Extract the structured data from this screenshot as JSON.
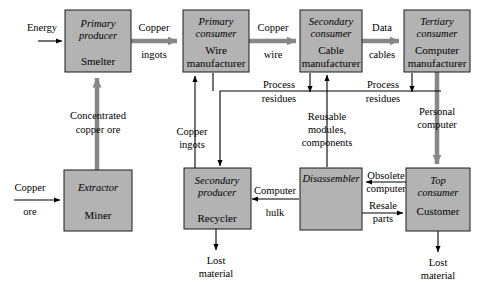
{
  "diagram": {
    "colors": {
      "node_fill": "#b3b3b3",
      "node_stroke": "#1a1a1a",
      "thin_arrow": "#000000",
      "thick_arrow": "#878787",
      "background": "#ffffff"
    },
    "nodes": [
      {
        "id": "primary_producer",
        "role": "Primary",
        "role2": "producer",
        "name": "Smelter",
        "name2": ""
      },
      {
        "id": "primary_consumer",
        "role": "Primary",
        "role2": "consumer",
        "name": "Wire",
        "name2": "manufacturer"
      },
      {
        "id": "secondary_consumer",
        "role": "Secondary",
        "role2": "consumer",
        "name": "Cable",
        "name2": "manufacturer"
      },
      {
        "id": "tertiary_consumer",
        "role": "Tertiary",
        "role2": "consumer",
        "name": "Computer",
        "name2": "manufacturer"
      },
      {
        "id": "extractor",
        "role": "Extractor",
        "role2": "",
        "name": "Miner",
        "name2": ""
      },
      {
        "id": "secondary_producer",
        "role": "Secondary",
        "role2": "producer",
        "name": "Recycler",
        "name2": ""
      },
      {
        "id": "disassembler",
        "role": "Disassembler",
        "role2": "",
        "name": "",
        "name2": ""
      },
      {
        "id": "top_consumer",
        "role": "Top",
        "role2": "consumer",
        "name": "Customer",
        "name2": ""
      }
    ],
    "edges": [
      {
        "id": "energy_in",
        "label": "Energy",
        "label2": "",
        "kind": "thin"
      },
      {
        "id": "copper_ingots_out",
        "label": "Copper",
        "label2": "ingots",
        "kind": "thick"
      },
      {
        "id": "copper_wire",
        "label": "Copper",
        "label2": "wire",
        "kind": "thick"
      },
      {
        "id": "data_cables",
        "label": "Data",
        "label2": "cables",
        "kind": "thick"
      },
      {
        "id": "concentrated_copper_ore",
        "label": "Concentrated",
        "label2": "copper ore",
        "kind": "thick"
      },
      {
        "id": "copper_ore_in",
        "label": "Copper",
        "label2": "ore",
        "kind": "thin"
      },
      {
        "id": "copper_ingots_recycled",
        "label": "Copper",
        "label2": "ingots",
        "kind": "thin"
      },
      {
        "id": "process_residues_left",
        "label": "Process",
        "label2": "residues",
        "kind": "thin"
      },
      {
        "id": "process_residues_right",
        "label": "Process",
        "label2": "residues",
        "kind": "thin"
      },
      {
        "id": "reusable_modules",
        "label": "Reusable",
        "label2": "modules,",
        "label3": "components",
        "kind": "thin"
      },
      {
        "id": "personal_computer",
        "label": "Personal",
        "label2": "computer",
        "kind": "thick"
      },
      {
        "id": "obsolete_computer",
        "label": "Obsolete",
        "label2": "computer",
        "kind": "thin"
      },
      {
        "id": "resale_parts",
        "label": "Resale",
        "label2": "parts",
        "kind": "thin"
      },
      {
        "id": "computer_hulk",
        "label": "Computer",
        "label2": "hulk",
        "kind": "thin"
      },
      {
        "id": "lost_material_recycler",
        "label": "Lost",
        "label2": "material",
        "kind": "thin"
      },
      {
        "id": "lost_material_customer",
        "label": "Lost",
        "label2": "material",
        "kind": "thin"
      }
    ]
  }
}
